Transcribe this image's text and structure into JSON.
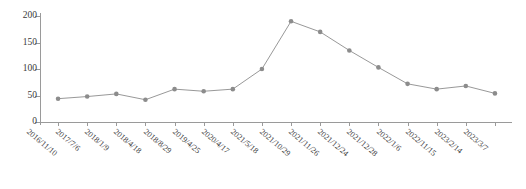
{
  "chart_data": {
    "type": "line",
    "title": "",
    "xlabel": "",
    "ylabel": "",
    "ylim": [
      0,
      200
    ],
    "yticks": [
      0,
      50,
      100,
      150,
      200
    ],
    "grid": false,
    "legend": "none",
    "series_name": "",
    "line_color": "#8c8c8c",
    "marker_color": "#8c8c8c",
    "marker": "circle",
    "categories": [
      "2016/11/10",
      "2017/7/6",
      "2018/1/9",
      "2018/4/18",
      "2018/8/29",
      "2019/4/25",
      "2020/4/17",
      "2021/5/18",
      "2021/10/29",
      "2021/11/26",
      "2021/12/24",
      "2021/12/28",
      "2022/1/6",
      "2022/11/15",
      "2023/2/14",
      "2023/3/7"
    ],
    "values": [
      44,
      48,
      53,
      42,
      62,
      58,
      62,
      100,
      190,
      170,
      135,
      103,
      72,
      62,
      68,
      54
    ]
  },
  "axes": {
    "y_tick_labels": [
      "200",
      "150",
      "100",
      "50",
      "0"
    ]
  },
  "caption": {
    "text": ""
  }
}
